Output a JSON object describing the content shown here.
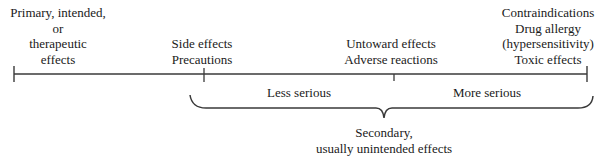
{
  "diagram": {
    "type": "spectrum-of-drug-effects",
    "colors": {
      "line": "#3a3a3a",
      "text": "#1a1a1a",
      "background": "#ffffff"
    },
    "top_labels": [
      {
        "id": "primary",
        "lines": [
          "Primary, intended,",
          "or",
          "therapeutic",
          "effects"
        ]
      },
      {
        "id": "side",
        "lines": [
          "Side effects",
          "Precautions"
        ]
      },
      {
        "id": "untoward",
        "lines": [
          "Untoward effects",
          "Adverse reactions"
        ]
      },
      {
        "id": "contra",
        "lines": [
          "Contraindications",
          "Drug allergy",
          "(hypersensitivity)",
          "Toxic effects"
        ]
      }
    ],
    "severity_labels": {
      "less": "Less serious",
      "more": "More serious"
    },
    "brace_label": {
      "lines": [
        "Secondary,",
        "usually unintended effects"
      ]
    }
  }
}
